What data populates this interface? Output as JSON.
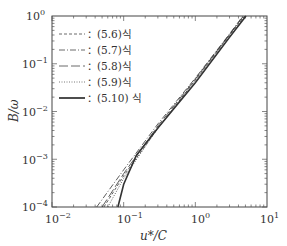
{
  "chart_data": {
    "type": "line",
    "title": "",
    "xlabel": "u*/C",
    "ylabel": "B/ω",
    "xscale": "log",
    "yscale": "log",
    "xlim": [
      0.01,
      10
    ],
    "ylim": [
      0.0001,
      1
    ],
    "x_ticks": [
      "10^-2",
      "10^-1",
      "10^0",
      "10^1"
    ],
    "y_ticks": [
      "10^-4",
      "10^-3",
      "10^-2",
      "10^-1",
      "10^0"
    ],
    "grid": false,
    "legend_position": "upper left",
    "series": [
      {
        "name": "(5.6)식",
        "style": "dashed",
        "x": [
          0.053,
          0.1,
          0.3,
          1.0,
          3.0,
          4.9
        ],
        "y": [
          0.0001,
          0.00045,
          0.0045,
          0.045,
          0.4,
          1.0
        ]
      },
      {
        "name": "(5.7)식",
        "style": "dash-dot",
        "x": [
          0.042,
          0.1,
          0.3,
          1.0,
          3.0,
          4.6
        ],
        "y": [
          0.0001,
          0.0006,
          0.0055,
          0.05,
          0.42,
          1.0
        ]
      },
      {
        "name": "(5.8)식",
        "style": "long-dash",
        "x": [
          0.05,
          0.1,
          0.3,
          1.0,
          3.0,
          4.7
        ],
        "y": [
          0.0001,
          0.0005,
          0.005,
          0.048,
          0.41,
          1.0
        ]
      },
      {
        "name": "(5.9)식",
        "style": "dotted",
        "x": [
          0.06,
          0.1,
          0.3,
          1.0,
          3.0,
          4.8
        ],
        "y": [
          0.0001,
          0.0004,
          0.0045,
          0.046,
          0.41,
          1.0
        ]
      },
      {
        "name": "(5.10) 식",
        "style": "solid",
        "x": [
          0.083,
          0.1,
          0.15,
          0.3,
          1.0,
          3.0,
          5.1
        ],
        "y": [
          0.0001,
          0.0003,
          0.0012,
          0.0045,
          0.04,
          0.36,
          1.0
        ]
      }
    ]
  },
  "legend": {
    "items": [
      {
        "label": "：(5.6)식"
      },
      {
        "label": "：(5.7)식"
      },
      {
        "label": "：(5.8)식"
      },
      {
        "label": "：(5.9)식"
      },
      {
        "label": "：(5.10) 식"
      }
    ]
  },
  "axes": {
    "xlabel": "u*/C",
    "ylabel": "B/ω",
    "x_tick_labels": [
      {
        "base": "10",
        "exp": "−2"
      },
      {
        "base": "10",
        "exp": "−1"
      },
      {
        "base": "10",
        "exp": "0"
      },
      {
        "base": "10",
        "exp": "1"
      }
    ],
    "y_tick_labels": [
      {
        "base": "10",
        "exp": "0"
      },
      {
        "base": "10",
        "exp": "−1"
      },
      {
        "base": "10",
        "exp": "−2"
      },
      {
        "base": "10",
        "exp": "−3"
      },
      {
        "base": "10",
        "exp": "−4"
      }
    ]
  }
}
